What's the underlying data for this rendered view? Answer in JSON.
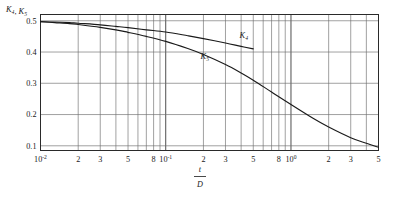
{
  "chart_data": {
    "type": "line",
    "title": "",
    "subtitle": "",
    "xlabel_numerator": "t",
    "xlabel_denominator": "D",
    "ylabel_parts": [
      {
        "base": "K",
        "sub": "4"
      },
      {
        "sep": ", "
      },
      {
        "base": "K",
        "sub": "5"
      }
    ],
    "ylabel_text": "K4, K5",
    "xscale": "log",
    "yscale": "linear",
    "xlim": [
      0.01,
      5
    ],
    "ylim": [
      0.085,
      0.52
    ],
    "grid": true,
    "legend_position": "inline-annotation",
    "y_ticks": [
      0.1,
      0.2,
      0.3,
      0.4,
      0.5
    ],
    "y_tick_labels": [
      "0.1",
      "0.2",
      "0.3",
      "0.4",
      "0.5"
    ],
    "x_major_ticks": [
      0.01,
      0.1,
      1
    ],
    "x_major_tick_labels": [
      "10-2",
      "10-1",
      "100"
    ],
    "x_major_tick_mantissa": [
      "10",
      "10",
      "10"
    ],
    "x_major_tick_exponent": [
      "-2",
      "-1",
      "0"
    ],
    "x_minor_ticks": [
      0.02,
      0.03,
      0.05,
      0.08,
      0.2,
      0.3,
      0.5,
      0.8,
      2,
      3,
      5
    ],
    "x_minor_tick_labels": [
      "2",
      "3",
      "5",
      "8",
      "2",
      "3",
      "5",
      "8",
      "2",
      "3",
      "5"
    ],
    "x_gridline_values": [
      0.01,
      0.02,
      0.03,
      0.04,
      0.05,
      0.06,
      0.07,
      0.08,
      0.09,
      0.1,
      0.2,
      0.3,
      0.4,
      0.5,
      0.6,
      0.7,
      0.8,
      0.9,
      1,
      2,
      3,
      4,
      5
    ],
    "series": [
      {
        "name": "K4",
        "label_base": "K",
        "label_sub": "4",
        "color": "#1a1a1a",
        "label_x": 0.42,
        "label_y": 0.445,
        "points": [
          {
            "x": 0.01,
            "y": 0.497
          },
          {
            "x": 0.013,
            "y": 0.496
          },
          {
            "x": 0.017,
            "y": 0.494
          },
          {
            "x": 0.02,
            "y": 0.492
          },
          {
            "x": 0.03,
            "y": 0.487
          },
          {
            "x": 0.04,
            "y": 0.482
          },
          {
            "x": 0.05,
            "y": 0.478
          },
          {
            "x": 0.07,
            "y": 0.471
          },
          {
            "x": 0.1,
            "y": 0.464
          },
          {
            "x": 0.15,
            "y": 0.452
          },
          {
            "x": 0.2,
            "y": 0.443
          },
          {
            "x": 0.3,
            "y": 0.429
          },
          {
            "x": 0.4,
            "y": 0.418
          },
          {
            "x": 0.5,
            "y": 0.41
          }
        ]
      },
      {
        "name": "K5",
        "label_base": "K",
        "label_sub": "5",
        "color": "#1a1a1a",
        "label_x": 0.205,
        "label_y": 0.378,
        "points": [
          {
            "x": 0.01,
            "y": 0.497
          },
          {
            "x": 0.013,
            "y": 0.494
          },
          {
            "x": 0.017,
            "y": 0.491
          },
          {
            "x": 0.02,
            "y": 0.488
          },
          {
            "x": 0.03,
            "y": 0.479
          },
          {
            "x": 0.04,
            "y": 0.471
          },
          {
            "x": 0.05,
            "y": 0.463
          },
          {
            "x": 0.07,
            "y": 0.45
          },
          {
            "x": 0.1,
            "y": 0.434
          },
          {
            "x": 0.15,
            "y": 0.411
          },
          {
            "x": 0.2,
            "y": 0.392
          },
          {
            "x": 0.3,
            "y": 0.36
          },
          {
            "x": 0.4,
            "y": 0.333
          },
          {
            "x": 0.5,
            "y": 0.31
          },
          {
            "x": 0.7,
            "y": 0.272
          },
          {
            "x": 1.0,
            "y": 0.232
          },
          {
            "x": 1.5,
            "y": 0.188
          },
          {
            "x": 2.0,
            "y": 0.16
          },
          {
            "x": 3.0,
            "y": 0.126
          },
          {
            "x": 4.0,
            "y": 0.108
          },
          {
            "x": 5.0,
            "y": 0.095
          }
        ]
      }
    ]
  }
}
